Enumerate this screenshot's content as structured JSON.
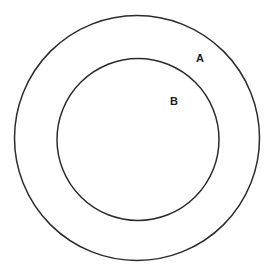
{
  "diagram": {
    "type": "venn-containment",
    "background_color": "#ffffff",
    "stroke_color": "#2b2b2b",
    "label_color": "#1c1c1c",
    "sets": [
      {
        "id": "outer",
        "label": "A",
        "cx": 137,
        "cy": 138,
        "r": 122.5,
        "stroke_width": 1.5,
        "fill": "none",
        "label_x": 196,
        "label_y": 53
      },
      {
        "id": "inner",
        "label": "B",
        "cx": 138,
        "cy": 139.5,
        "r": 81,
        "stroke_width": 1.5,
        "fill": "none",
        "label_x": 170,
        "label_y": 96
      }
    ]
  }
}
